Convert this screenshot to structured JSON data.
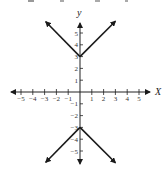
{
  "chart_data": {
    "type": "line",
    "title": "",
    "xlabel": "x",
    "ylabel": "y",
    "xlim": [
      -6,
      6
    ],
    "ylim": [
      -6,
      6
    ],
    "grid": false,
    "x_ticks": [
      -5,
      -4,
      -3,
      -2,
      -1,
      1,
      2,
      3,
      4,
      5
    ],
    "y_ticks": [
      -5,
      -4,
      -3,
      -2,
      -1,
      1,
      2,
      3,
      4,
      5
    ],
    "x_tick_labels": [
      "−5",
      "−4",
      "−3",
      "−2",
      "−1",
      "1",
      "2",
      "3",
      "4",
      "5"
    ],
    "y_tick_labels_pos": [
      "1",
      "2",
      "3",
      "4",
      "5"
    ],
    "y_tick_labels_neg": [
      "−1",
      "−2",
      "−3",
      "−4",
      "−5"
    ],
    "series": [
      {
        "name": "upper branch",
        "equation": "y = |x| + 3",
        "points": [
          [
            -3,
            6
          ],
          [
            0,
            3
          ],
          [
            3,
            6
          ]
        ],
        "arrows": "both ends"
      },
      {
        "name": "lower branch",
        "equation": "y = -|x| - 3",
        "points": [
          [
            -3,
            -6
          ],
          [
            0,
            -3
          ],
          [
            3,
            -6
          ]
        ],
        "arrows": "both ends"
      }
    ],
    "line_color": "#1a1a1a",
    "axis_color": "#222222"
  },
  "labels": {
    "x_axis": "x",
    "y_axis": "y"
  }
}
